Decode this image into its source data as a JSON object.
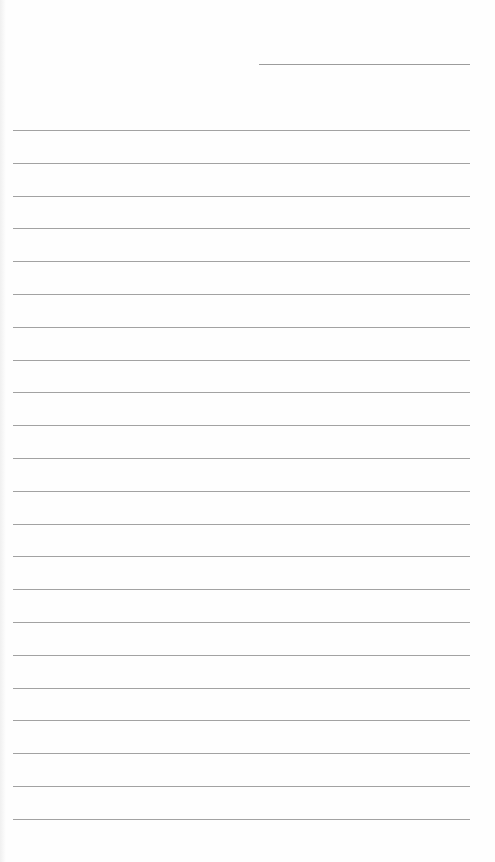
{
  "page": {
    "type": "lined-paper",
    "header_line": {
      "label": ""
    },
    "rule_count": 22,
    "rules": [
      {
        "text": ""
      },
      {
        "text": ""
      },
      {
        "text": ""
      },
      {
        "text": ""
      },
      {
        "text": ""
      },
      {
        "text": ""
      },
      {
        "text": ""
      },
      {
        "text": ""
      },
      {
        "text": ""
      },
      {
        "text": ""
      },
      {
        "text": ""
      },
      {
        "text": ""
      },
      {
        "text": ""
      },
      {
        "text": ""
      },
      {
        "text": ""
      },
      {
        "text": ""
      },
      {
        "text": ""
      },
      {
        "text": ""
      },
      {
        "text": ""
      },
      {
        "text": ""
      },
      {
        "text": ""
      },
      {
        "text": ""
      }
    ],
    "colors": {
      "paper": "#fefefe",
      "rule": "#a2a2a2"
    }
  }
}
